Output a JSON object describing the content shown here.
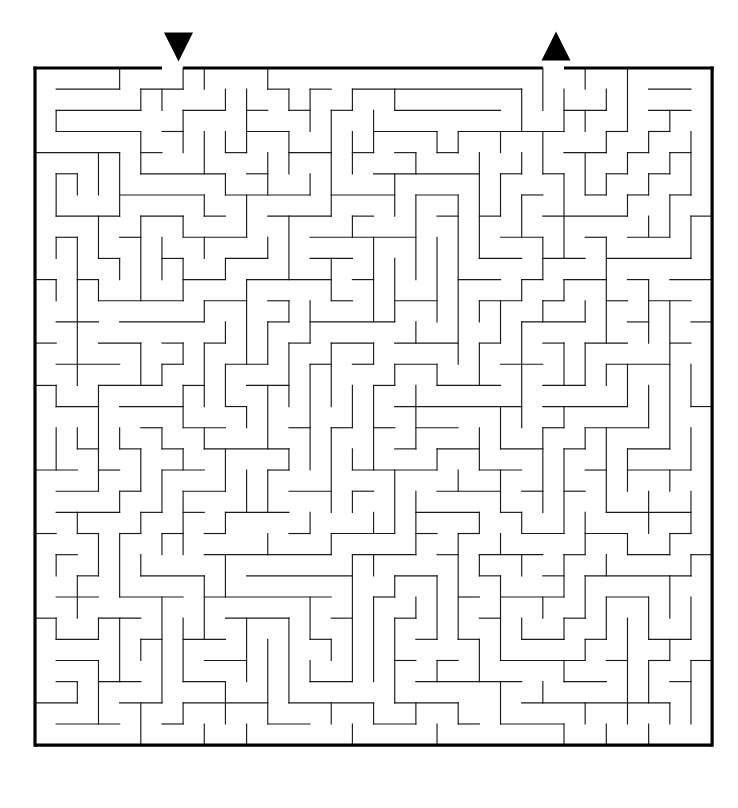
{
  "maze": {
    "description": "Square grid maze puzzle with a solid black outer border, thin black interior walls, a black down-pointing triangle marking the entrance gap in the top wall and a black up-pointing triangle marking the exit gap in the top wall.",
    "title": "",
    "grid": {
      "cols": 32,
      "rows": 32,
      "cell_size": 21.16,
      "origin_x": 35,
      "origin_y": 68,
      "width": 677,
      "height": 677
    },
    "style": {
      "background_color": "#ffffff",
      "wall_color": "#1a1a1a",
      "border_color": "#000000",
      "marker_color": "#000000",
      "wall_thickness": 1.15,
      "border_thickness": 3.2
    },
    "openings": [
      {
        "name": "entrance",
        "side": "top",
        "col": 6,
        "marker": "triangle-down"
      },
      {
        "name": "exit",
        "side": "top",
        "col": 24,
        "marker": "triangle-up"
      }
    ],
    "markers": [
      {
        "name": "entrance-marker",
        "glyph": "triangle-down",
        "center_x": 178.5,
        "center_y": 47,
        "half_width": 14.5,
        "height": 29
      },
      {
        "name": "exit-marker",
        "glyph": "triangle-up",
        "center_x": 556,
        "center_y": 46,
        "half_width": 14.5,
        "height": 29
      }
    ],
    "seed": 20240517
  }
}
